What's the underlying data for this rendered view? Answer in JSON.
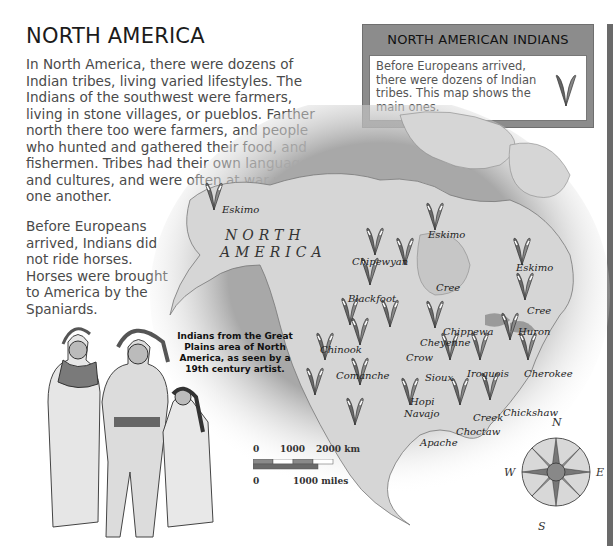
{
  "page": {
    "title": "NORTH AMERICA",
    "intro": "In North America, there were dozens of Indian tribes, living varied lifestyles. The Indians of the southwest were farmers, living in stone villages, or pueblos. Farther north there too were farmers, and people who hunted and gathered their food, and fishermen. Tribes had their own languages and cultures, and were often at war with one another.",
    "horses_note": "Before Europeans arrived, Indians did not ride horses. Horses were brought to America by the Spaniards."
  },
  "infobox": {
    "title": "NORTH AMERICAN INDIANS",
    "text": "Before Europeans arrived, there were dozens of Indian tribes. This map shows the main ones.",
    "icon": "feather-icon"
  },
  "map": {
    "region_label_1": "NORTH",
    "region_label_2": "AMERICA",
    "tribes": [
      {
        "name": "Eskimo",
        "x": 222,
        "y": 211
      },
      {
        "name": "Eskimo",
        "x": 428,
        "y": 235
      },
      {
        "name": "Eskimo",
        "x": 516,
        "y": 268
      },
      {
        "name": "Chipewyan",
        "x": 352,
        "y": 261
      },
      {
        "name": "Cree",
        "x": 435,
        "y": 287
      },
      {
        "name": "Cree",
        "x": 527,
        "y": 310
      },
      {
        "name": "Blackfoot",
        "x": 348,
        "y": 298
      },
      {
        "name": "Chippewa",
        "x": 443,
        "y": 330
      },
      {
        "name": "Huron",
        "x": 518,
        "y": 331
      },
      {
        "name": "Cheyenne",
        "x": 420,
        "y": 341
      },
      {
        "name": "Chinook",
        "x": 320,
        "y": 348
      },
      {
        "name": "Crow",
        "x": 406,
        "y": 357
      },
      {
        "name": "Comanche",
        "x": 336,
        "y": 374
      },
      {
        "name": "Sioux",
        "x": 425,
        "y": 376
      },
      {
        "name": "Iroquois",
        "x": 467,
        "y": 372
      },
      {
        "name": "Cherokee",
        "x": 524,
        "y": 373
      },
      {
        "name": "Hopi",
        "x": 410,
        "y": 400
      },
      {
        "name": "Navajo",
        "x": 404,
        "y": 413
      },
      {
        "name": "Chickshaw",
        "x": 503,
        "y": 412
      },
      {
        "name": "Creek",
        "x": 473,
        "y": 417
      },
      {
        "name": "Choctaw",
        "x": 456,
        "y": 430
      },
      {
        "name": "Apache",
        "x": 420,
        "y": 441
      }
    ]
  },
  "caption": "Indians from the Great Plains area of North America, as seen by a 19th century artist.",
  "scale": {
    "km_0": "0",
    "km_1000": "1000",
    "km_2000": "2000 km",
    "mi_0": "0",
    "mi_1000": "1000 miles"
  },
  "compass": {
    "n": "N",
    "s": "S",
    "e": "E",
    "w": "W"
  },
  "colors": {
    "ocean": "#9a9a9a",
    "land": "#d6d6d6",
    "box_gray": "#8c8c8c",
    "strip": "#6a6a6a"
  }
}
